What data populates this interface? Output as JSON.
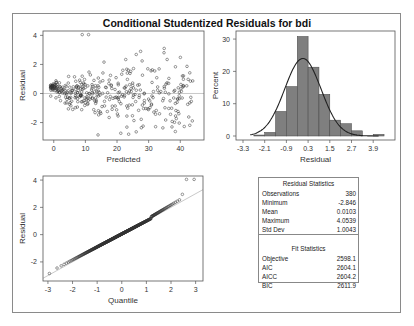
{
  "title": "Conditional Studentized Residuals for bdi",
  "chart_data": [
    {
      "type": "scatter",
      "title": "Residual vs Predicted",
      "xlabel": "Predicted",
      "ylabel": "Residual",
      "xticks": [
        0,
        10,
        20,
        30,
        40
      ],
      "yticks": [
        -2,
        0,
        2,
        4
      ],
      "xlim": [
        -3.4,
        47.5
      ],
      "ylim": [
        -3.2,
        4.3
      ],
      "reference_line_y": 0,
      "n_points": 380
    },
    {
      "type": "bar",
      "title": "Histogram of Residuals",
      "xlabel": "Residual",
      "ylabel": "Percent",
      "xticks": [
        "-3.3",
        "-2.1",
        "-0.9",
        "0.3",
        "1.5",
        "2.7",
        "3.9"
      ],
      "yticks": [
        0,
        10,
        20,
        30
      ],
      "ylim": [
        0,
        32.5
      ],
      "bin_width": 0.6,
      "categories": [
        "-2.7",
        "-2.1",
        "-1.5",
        "-0.9",
        "-0.3",
        "0.3",
        "0.9",
        "1.5",
        "2.1",
        "2.7",
        "3.3",
        "3.9"
      ],
      "values": [
        0.3,
        1.1,
        7.6,
        15.3,
        30.8,
        21.3,
        12.9,
        4.9,
        3.8,
        1.6,
        0.0,
        0.5
      ],
      "overlay": "normal density curve"
    },
    {
      "type": "scatter",
      "title": "Q-Q Plot of Residuals",
      "xlabel": "Quantile",
      "ylabel": "Residual",
      "xticks": [
        -3,
        -2,
        -1,
        0,
        1,
        2,
        3
      ],
      "yticks": [
        -2,
        0,
        2,
        4
      ],
      "xlim": [
        -3.2,
        3.3
      ],
      "ylim": [
        -3.4,
        4.3
      ],
      "reference_line": "y = x"
    },
    {
      "type": "table",
      "sections": [
        {
          "title": "Residual Statistics",
          "rows": [
            [
              "Observations",
              "380"
            ],
            [
              "Minimum",
              "-2.846"
            ],
            [
              "Mean",
              "0.0103"
            ],
            [
              "Maximum",
              "4.0539"
            ],
            [
              "Std Dev",
              "1.0043"
            ]
          ]
        },
        {
          "title": "Fit Statistics",
          "rows": [
            [
              "Objective",
              "2598.1"
            ],
            [
              "AIC",
              "2604.1"
            ],
            [
              "AICC",
              "2604.2"
            ],
            [
              "BIC",
              "2611.9"
            ]
          ]
        }
      ]
    }
  ],
  "stats": {
    "residual_title": "Residual Statistics",
    "residual_rows": [
      {
        "label": "Observations",
        "value": "380"
      },
      {
        "label": "Minimum",
        "value": "-2.846"
      },
      {
        "label": "Mean",
        "value": "0.0103"
      },
      {
        "label": "Maximum",
        "value": "4.0539"
      },
      {
        "label": "Std Dev",
        "value": "1.0043"
      }
    ],
    "fit_title": "Fit Statistics",
    "fit_rows": [
      {
        "label": "Objective",
        "value": "2598.1"
      },
      {
        "label": "AIC",
        "value": "2604.1"
      },
      {
        "label": "AICC",
        "value": "2604.2"
      },
      {
        "label": "BIC",
        "value": "2611.9"
      }
    ]
  },
  "colors": {
    "bar_fill": "#7f7f7f",
    "axis": "#555555",
    "ref_line": "#bbbbbb",
    "curve": "#222222"
  }
}
